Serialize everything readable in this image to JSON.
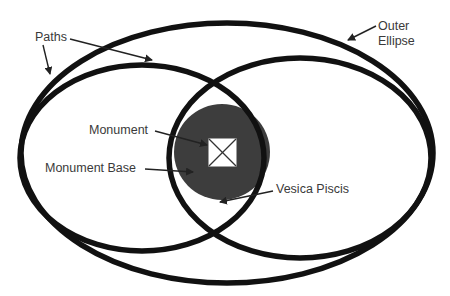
{
  "diagram": {
    "labels": {
      "paths": "Paths",
      "outer_ellipse_line1": "Outer",
      "outer_ellipse_line2": "Ellipse",
      "monument": "Monument",
      "monument_base": "Monument Base",
      "vesica_piscis": "Vesica Piscis"
    },
    "colors": {
      "stroke": "#111111",
      "base_fill": "#3d3d3d",
      "monument_fill": "#ffffff",
      "text": "#3a3a3a",
      "background": "#ffffff"
    }
  }
}
